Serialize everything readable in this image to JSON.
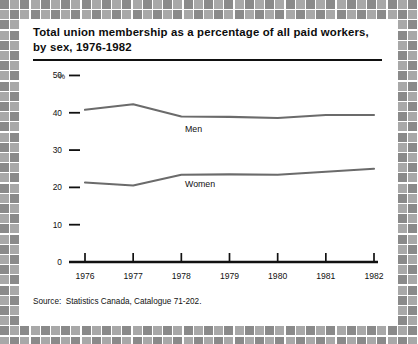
{
  "title": {
    "line1": "Total union membership as a percentage of all paid workers,",
    "line2": "by sex, 1976-1982"
  },
  "source": {
    "label": "Source:",
    "text": "Statistics Canada, Catalogue 71-202."
  },
  "axis": {
    "y_unit": "%",
    "y_ticks": [
      "50",
      "40",
      "30",
      "20",
      "10",
      "0"
    ],
    "x_ticks": [
      "1976",
      "1977",
      "1978",
      "1979",
      "1980",
      "1981",
      "1982"
    ]
  },
  "colors": {
    "line": "#6b6b6b",
    "axis": "#111111",
    "text": "#111111",
    "frame_light": "#a8a8a8",
    "frame_dark": "#8a8a8a",
    "page_bg": "#ffffff"
  },
  "chart_data": {
    "type": "line",
    "title": "Total union membership as a percentage of all paid workers, by sex, 1976-1982",
    "xlabel": "",
    "ylabel": "%",
    "x": [
      1976,
      1977,
      1978,
      1979,
      1980,
      1981,
      1982
    ],
    "categories": [
      "1976",
      "1977",
      "1978",
      "1979",
      "1980",
      "1981",
      "1982"
    ],
    "series": [
      {
        "name": "Men",
        "values": [
          40.8,
          42.3,
          39.0,
          38.9,
          38.6,
          39.4,
          39.4
        ]
      },
      {
        "name": "Women",
        "values": [
          21.3,
          20.5,
          23.4,
          23.5,
          23.4,
          24.2,
          25.0
        ]
      }
    ],
    "ylim": [
      0,
      52
    ],
    "yticks": [
      0,
      10,
      20,
      30,
      40,
      50
    ],
    "grid": false,
    "legend": "inline-labels",
    "annotations": [
      "Men",
      "Women"
    ]
  }
}
